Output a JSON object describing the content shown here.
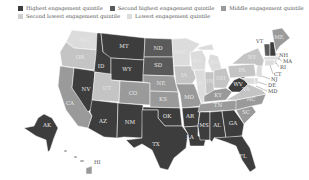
{
  "legend": {
    "items": [
      {
        "label": "Highest engagement quintile",
        "color": "#3d3d3d"
      },
      {
        "label": "Second highest engagement quintile",
        "color": "#5a5a5a"
      },
      {
        "label": "Middle engagement quintile",
        "color": "#9a9a9a"
      },
      {
        "label": "Second lowest engagement quintile",
        "color": "#cfcfcf"
      },
      {
        "label": "Lowest engagement quintile",
        "color": "#dcdcdc"
      }
    ]
  },
  "map": {
    "title": "",
    "quintile_colors": {
      "q5": "#3d3d3d",
      "q4": "#5a5a5a",
      "q3": "#9a9a9a",
      "q2": "#c4c4c4",
      "q1": "#dcdcdc"
    },
    "states": {
      "WA": {
        "label": "WA",
        "quintile": "q1"
      },
      "OR": {
        "label": "OR",
        "quintile": "q2"
      },
      "CA": {
        "label": "CA",
        "quintile": "q3"
      },
      "NV": {
        "label": "NV",
        "quintile": "q5"
      },
      "ID": {
        "label": "ID",
        "quintile": "q5"
      },
      "MT": {
        "label": "MT",
        "quintile": "q5"
      },
      "WY": {
        "label": "WY",
        "quintile": "q5"
      },
      "UT": {
        "label": "UT",
        "quintile": "q2"
      },
      "CO": {
        "label": "CO",
        "quintile": "q3"
      },
      "AZ": {
        "label": "AZ",
        "quintile": "q5"
      },
      "NM": {
        "label": "NM",
        "quintile": "q5"
      },
      "ND": {
        "label": "ND",
        "quintile": "q4"
      },
      "SD": {
        "label": "SD",
        "quintile": "q4"
      },
      "NE": {
        "label": "NE",
        "quintile": "q3"
      },
      "KS": {
        "label": "KS",
        "quintile": "q3"
      },
      "OK": {
        "label": "OK",
        "quintile": "q5"
      },
      "TX": {
        "label": "TX",
        "quintile": "q5"
      },
      "MN": {
        "label": "MN",
        "quintile": "q1"
      },
      "IA": {
        "label": "IA",
        "quintile": "q2"
      },
      "MO": {
        "label": "MO",
        "quintile": "q3"
      },
      "AR": {
        "label": "AR",
        "quintile": "q5"
      },
      "LA": {
        "label": "LA",
        "quintile": "q5"
      },
      "WI": {
        "label": "WI",
        "quintile": "q1"
      },
      "IL": {
        "label": "IL",
        "quintile": "q1"
      },
      "MI": {
        "label": "MI",
        "quintile": "q1"
      },
      "IN": {
        "label": "IN",
        "quintile": "q2"
      },
      "OH": {
        "label": "OH",
        "quintile": "q2"
      },
      "KY": {
        "label": "KY",
        "quintile": "q3"
      },
      "TN": {
        "label": "TN",
        "quintile": "q3"
      },
      "MS": {
        "label": "MS",
        "quintile": "q5"
      },
      "AL": {
        "label": "AL",
        "quintile": "q5"
      },
      "GA": {
        "label": "GA",
        "quintile": "q5"
      },
      "FL": {
        "label": "FL",
        "quintile": "q5"
      },
      "SC": {
        "label": "SC",
        "quintile": "q3"
      },
      "NC": {
        "label": "NC",
        "quintile": "q3"
      },
      "VA": {
        "label": "VA",
        "quintile": "q2"
      },
      "WV": {
        "label": "WV",
        "quintile": "q5"
      },
      "PA": {
        "label": "PA",
        "quintile": "q2"
      },
      "NY": {
        "label": "NY",
        "quintile": "q2"
      },
      "VT": {
        "label": "VT",
        "quintile": "q4"
      },
      "NH": {
        "label": "NH",
        "quintile": "q5"
      },
      "ME": {
        "label": "ME",
        "quintile": "q3"
      },
      "MA": {
        "label": "MA",
        "quintile": "q1"
      },
      "RI": {
        "label": "RI",
        "quintile": "q1"
      },
      "CT": {
        "label": "CT",
        "quintile": "q1"
      },
      "NJ": {
        "label": "NJ",
        "quintile": "q1"
      },
      "DE": {
        "label": "DE",
        "quintile": "q1"
      },
      "MD": {
        "label": "MD",
        "quintile": "q1"
      },
      "AK": {
        "label": "AK",
        "quintile": "q5"
      },
      "HI": {
        "label": "HI",
        "quintile": "q3"
      }
    }
  }
}
